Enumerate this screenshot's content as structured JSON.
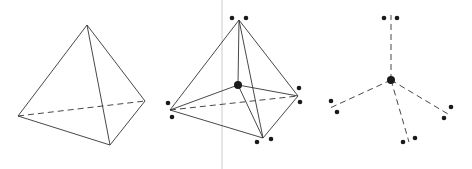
{
  "diagram": {
    "title": "",
    "panels": [
      {
        "name": "tetrahedron",
        "description": "Tetrahedron wireframe with one hidden edge dashed"
      },
      {
        "name": "tetrahedron-with-center",
        "description": "Tetrahedron with central atom bonded to four vertices, each vertex with electron-pair dots"
      },
      {
        "name": "tetrahedral-bonds",
        "description": "Central atom with four dashed bonds and lone pair dots"
      }
    ],
    "colors": {
      "line": "#333333",
      "dot": "#1a1a1a",
      "divider": "#cccccc"
    }
  }
}
